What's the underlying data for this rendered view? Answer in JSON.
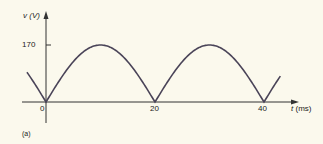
{
  "chart_data": {
    "type": "line",
    "title": "",
    "xlabel": "t (ms)",
    "ylabel": "v (V)",
    "x_ticks": [
      "0",
      "20",
      "40"
    ],
    "y_ticks": [
      "170"
    ],
    "series": [
      {
        "name": "full-wave rectified voltage",
        "description": "v = |170 sin(2*pi*25*t)|, period 20 ms",
        "x": [
          -3.5,
          0,
          5,
          10,
          15,
          20,
          25,
          30,
          35,
          40,
          43
        ],
        "values": [
          70,
          0,
          120,
          170,
          120,
          0,
          120,
          170,
          120,
          0,
          70
        ]
      }
    ],
    "xlim": [
      -3.5,
      43
    ],
    "ylim": [
      0,
      170
    ],
    "grid": false,
    "color": "#4a4458"
  },
  "labels": {
    "y_axis": "v (V)",
    "x_axis": "t (ms)",
    "y_tick": "170",
    "x_tick_0": "0",
    "x_tick_20": "20",
    "x_tick_40": "40",
    "caption": "(a)"
  }
}
